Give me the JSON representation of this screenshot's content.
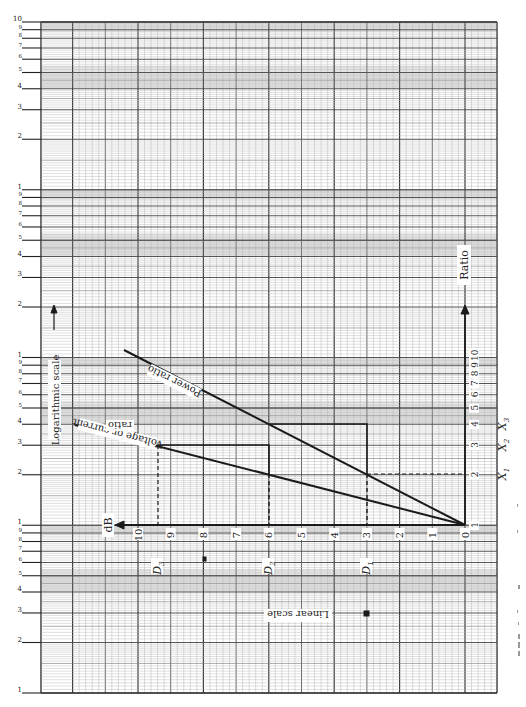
{
  "figure": {
    "type": "log-linear graph paper diagram",
    "left_log_scale_labels": {
      "decade_1": [
        "10",
        "9",
        "8",
        "7",
        "6",
        "5",
        "4",
        "3",
        "2",
        "1"
      ],
      "decade_2": [
        "9",
        "8",
        "7",
        "6",
        "5",
        "4",
        "3",
        "2",
        "1"
      ],
      "decade_3": [
        "9",
        "8",
        "7",
        "6",
        "5",
        "4",
        "3",
        "2",
        "1"
      ],
      "decade_4": [
        "9",
        "8",
        "7",
        "6",
        "5",
        "4",
        "3",
        "2",
        "1"
      ]
    },
    "axis_labels": {
      "log_scale": "Logarithmic scale",
      "linear_scale": "Linear scale",
      "db": "dB",
      "ratio": "Ratio"
    },
    "db_ticks": [
      "0",
      "1",
      "2",
      "3",
      "4",
      "5",
      "6",
      "7",
      "8",
      "9",
      "10"
    ],
    "ratio_ticks": [
      "1",
      "2",
      "3",
      "4",
      "5",
      "6",
      "7",
      "8",
      "9",
      "10"
    ],
    "line_labels": {
      "power": "Power ratio",
      "voltage_line1": "Voltage or current",
      "voltage_line2": "ratio"
    },
    "markers": {
      "d1": "D",
      "d1_sub": "1",
      "d2": "D",
      "d2_sub": "2",
      "d3": "D",
      "d3_sub": "3",
      "x1": "X",
      "x1_sub": "1",
      "x2": "X",
      "x2_sub": "2",
      "x3": "X",
      "x3_sub": "3"
    },
    "colors": {
      "ink": "#1a1a1a",
      "grid_minor": "#b8b8b8",
      "grid_major": "#555555",
      "shade": "#e4e4e4"
    }
  },
  "chart_data": {
    "type": "line",
    "title": "",
    "xlabel": "dB",
    "ylabel": "Ratio (logarithmic scale)",
    "x_direction": "decreasing to the right (0 dB at right, 10 dB at left)",
    "xlim": [
      0,
      10
    ],
    "ylim_log": [
      1,
      10
    ],
    "series": [
      {
        "name": "Power ratio",
        "x": [
          0,
          3,
          6,
          10
        ],
        "y": [
          1,
          2,
          4,
          10
        ]
      },
      {
        "name": "Voltage or current ratio",
        "x": [
          0,
          3,
          6,
          9.5
        ],
        "y": [
          1,
          1.41,
          2,
          3
        ]
      }
    ],
    "annotations": [
      {
        "label": "D1",
        "x": 3
      },
      {
        "label": "D2",
        "x": 6
      },
      {
        "label": "D3",
        "x": 9.5
      },
      {
        "label": "X1",
        "y": 2
      },
      {
        "label": "X2",
        "y": 3
      },
      {
        "label": "X3",
        "y": 4
      }
    ],
    "grid": true
  }
}
